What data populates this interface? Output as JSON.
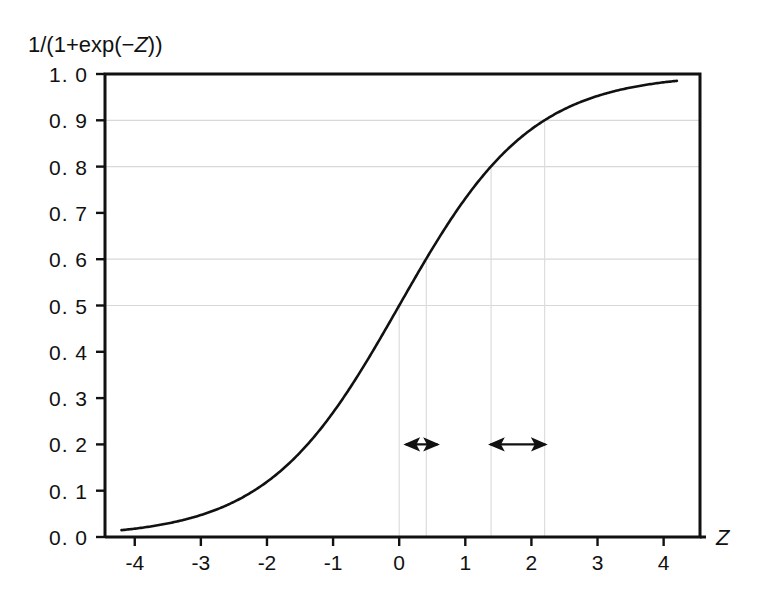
{
  "chart_data": {
    "type": "line",
    "title": "",
    "ylabel": "1/(1+exp(−Z))",
    "ylabel_parts": {
      "prefix": "1/(1+exp(−",
      "italic": "Z",
      "suffix": "))"
    },
    "xlabel": "Z",
    "xlim": [
      -4.45,
      4.55
    ],
    "ylim": [
      0.0,
      1.0
    ],
    "grid": "horizontal-partial",
    "legend": "none",
    "x_ticks": [
      -4,
      -3,
      -2,
      -1,
      0,
      1,
      2,
      3,
      4
    ],
    "x_tick_labels": [
      "-4",
      "-3",
      "-2",
      "-1",
      "0",
      "1",
      "2",
      "3",
      "4"
    ],
    "y_ticks": [
      0.0,
      0.1,
      0.2,
      0.3,
      0.4,
      0.5,
      0.6,
      0.7,
      0.8,
      0.9,
      1.0
    ],
    "y_tick_labels": [
      "0. 0",
      "0. 1",
      "0. 2",
      "0. 3",
      "0. 4",
      "0. 5",
      "0. 6",
      "0. 7",
      "0. 8",
      "0. 9",
      "1. 0"
    ],
    "gridlines_y": [
      0.5,
      0.6,
      0.8,
      0.9
    ],
    "curve": {
      "name": "logistic",
      "formula": "1/(1+exp(-Z))",
      "x_start": -4.2,
      "x_end": 4.2,
      "points": [
        [
          -4.2,
          0.015
        ],
        [
          -4.0,
          0.018
        ],
        [
          -3.8,
          0.022
        ],
        [
          -3.6,
          0.027
        ],
        [
          -3.4,
          0.032
        ],
        [
          -3.2,
          0.039
        ],
        [
          -3.0,
          0.047
        ],
        [
          -2.8,
          0.057
        ],
        [
          -2.6,
          0.069
        ],
        [
          -2.4,
          0.083
        ],
        [
          -2.2,
          0.1
        ],
        [
          -2.0,
          0.119
        ],
        [
          -1.8,
          0.142
        ],
        [
          -1.6,
          0.168
        ],
        [
          -1.4,
          0.198
        ],
        [
          -1.2,
          0.231
        ],
        [
          -1.0,
          0.269
        ],
        [
          -0.8,
          0.31
        ],
        [
          -0.6,
          0.354
        ],
        [
          -0.4,
          0.401
        ],
        [
          -0.2,
          0.45
        ],
        [
          0.0,
          0.5
        ],
        [
          0.2,
          0.55
        ],
        [
          0.4,
          0.599
        ],
        [
          0.6,
          0.646
        ],
        [
          0.8,
          0.69
        ],
        [
          1.0,
          0.731
        ],
        [
          1.2,
          0.769
        ],
        [
          1.4,
          0.802
        ],
        [
          1.6,
          0.832
        ],
        [
          1.8,
          0.858
        ],
        [
          2.0,
          0.881
        ],
        [
          2.2,
          0.9
        ],
        [
          2.4,
          0.917
        ],
        [
          2.6,
          0.931
        ],
        [
          2.8,
          0.943
        ],
        [
          3.0,
          0.953
        ],
        [
          3.2,
          0.961
        ],
        [
          3.4,
          0.968
        ],
        [
          3.6,
          0.973
        ],
        [
          3.8,
          0.978
        ],
        [
          4.0,
          0.982
        ],
        [
          4.2,
          0.985
        ]
      ]
    },
    "dropline_pairs": [
      {
        "label": "pair-1",
        "x_left": 0.0,
        "y_left": 0.5,
        "x_right": 0.41,
        "y_right": 0.6
      },
      {
        "label": "pair-2",
        "x_left": 1.39,
        "y_left": 0.8,
        "x_right": 2.2,
        "y_right": 0.9
      }
    ],
    "annotations": [
      {
        "type": "double-arrow",
        "name": "arrow-span-1",
        "x_start": 0.1,
        "x_end": 0.58,
        "y": 0.2
      },
      {
        "type": "double-arrow",
        "name": "arrow-span-2",
        "x_start": 1.38,
        "x_end": 2.21,
        "y": 0.2
      }
    ],
    "colors": {
      "curve": "#111111",
      "axis": "#111111",
      "gridline": "#d8d8d8",
      "dropline": "#dcdcdc",
      "annotation": "#111111",
      "background": "#ffffff"
    }
  }
}
